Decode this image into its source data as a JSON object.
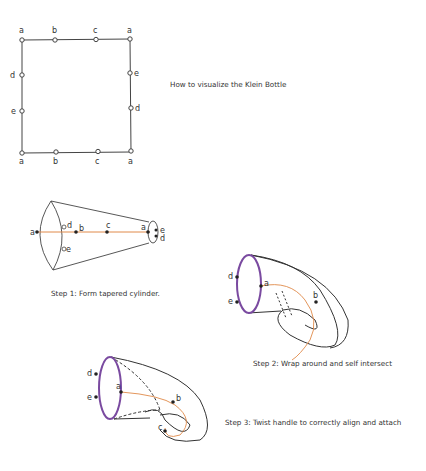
{
  "title": "How to visualize the Klein Bottle",
  "colors": {
    "line": "#3a3a3a",
    "orange": "#e08a4a",
    "purple": "#7a4aa0"
  },
  "square": {
    "top_labels": [
      "a",
      "b",
      "c",
      "a"
    ],
    "bottom_labels": [
      "a",
      "b",
      "c",
      "a"
    ],
    "left_labels": [
      "d",
      "e"
    ],
    "right_labels": [
      "e",
      "d"
    ]
  },
  "step1": {
    "caption": "Step 1: Form tapered cylinder.",
    "labels": {
      "a_left": "a",
      "d": "d",
      "e": "e",
      "b": "b",
      "c": "c",
      "a_right": "a",
      "e_right": "e",
      "d_right": "d"
    }
  },
  "step2": {
    "caption": "Step 2: Wrap around and self intersect",
    "labels": {
      "d": "d",
      "e": "e",
      "a": "a",
      "b": "b"
    }
  },
  "step3": {
    "caption": "Step 3: Twist handle to correctly align and attach",
    "labels": {
      "d": "d",
      "e": "e",
      "a": "a",
      "b": "b",
      "c": "c"
    }
  }
}
